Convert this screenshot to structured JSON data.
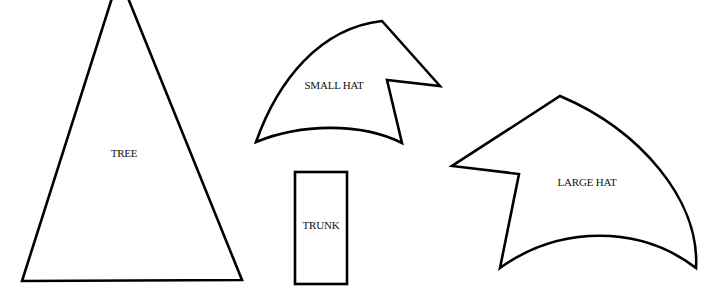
{
  "diagram": {
    "stroke_color": "#000000",
    "background": "#ffffff",
    "shapes": [
      {
        "id": "tree",
        "label": "TREE",
        "type": "triangle"
      },
      {
        "id": "small_hat",
        "label": "SMALL HAT",
        "type": "hat"
      },
      {
        "id": "trunk",
        "label": "TRUNK",
        "type": "rectangle"
      },
      {
        "id": "large_hat",
        "label": "LARGE HAT",
        "type": "hat"
      }
    ]
  }
}
